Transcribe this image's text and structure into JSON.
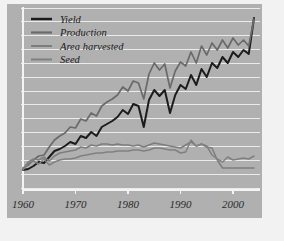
{
  "figure": {
    "panel_bg": "#b0b0b0",
    "outer_bg": "#f2f2f2",
    "grid_color": "#ebebeb",
    "axis_color": "#f4f4f4"
  },
  "chart_data": {
    "type": "line",
    "title": "",
    "subtitle": "",
    "xlabel": "",
    "ylabel": "",
    "xlim": [
      1960,
      2004
    ],
    "ylim": [
      0,
      360
    ],
    "grid": "horizontal",
    "legend_position": "top-left",
    "xticks": [
      1960,
      1970,
      1980,
      1990,
      2000
    ],
    "xtick_labels": [
      "1960",
      "1970",
      "1980",
      "1990",
      "2000"
    ],
    "x": [
      1960,
      1961,
      1962,
      1963,
      1964,
      1965,
      1966,
      1967,
      1968,
      1969,
      1970,
      1971,
      1972,
      1973,
      1974,
      1975,
      1976,
      1977,
      1978,
      1979,
      1980,
      1981,
      1982,
      1983,
      1984,
      1985,
      1986,
      1987,
      1988,
      1989,
      1990,
      1991,
      1992,
      1993,
      1994,
      1995,
      1996,
      1997,
      1998,
      1999,
      2000,
      2001,
      2002,
      2003,
      2004
    ],
    "series": [
      {
        "name": "Yield",
        "color": "#1c1c1c",
        "width": 2.0,
        "values": [
          36,
          38,
          44,
          52,
          50,
          62,
          74,
          78,
          84,
          92,
          88,
          104,
          100,
          112,
          104,
          122,
          128,
          134,
          142,
          156,
          148,
          168,
          164,
          122,
          176,
          196,
          184,
          196,
          150,
          186,
          206,
          198,
          226,
          206,
          238,
          222,
          250,
          240,
          262,
          250,
          272,
          262,
          276,
          268,
          340
        ]
      },
      {
        "name": "Production",
        "color": "#6a6a6a",
        "width": 1.7,
        "values": [
          40,
          46,
          56,
          64,
          66,
          82,
          96,
          104,
          110,
          122,
          120,
          138,
          134,
          150,
          144,
          164,
          172,
          178,
          186,
          202,
          194,
          214,
          210,
          178,
          228,
          250,
          236,
          248,
          200,
          234,
          252,
          244,
          272,
          250,
          284,
          266,
          290,
          276,
          296,
          280,
          300,
          286,
          296,
          284,
          338
        ]
      },
      {
        "name": "Area harvested",
        "color": "#7d7d7d",
        "width": 1.5,
        "values": [
          38,
          52,
          58,
          56,
          62,
          54,
          64,
          70,
          72,
          74,
          76,
          82,
          80,
          86,
          84,
          88,
          88,
          86,
          88,
          86,
          86,
          84,
          86,
          82,
          86,
          90,
          88,
          86,
          84,
          82,
          80,
          86,
          92,
          84,
          88,
          82,
          80,
          56,
          40,
          40,
          40,
          40,
          40,
          40,
          40
        ]
      },
      {
        "name": "Seed",
        "color": "#808080",
        "width": 1.5,
        "values": [
          36,
          50,
          54,
          48,
          58,
          46,
          52,
          56,
          58,
          58,
          60,
          64,
          66,
          68,
          70,
          70,
          72,
          72,
          74,
          74,
          74,
          76,
          76,
          74,
          76,
          80,
          80,
          78,
          76,
          76,
          70,
          72,
          96,
          84,
          88,
          84,
          66,
          58,
          52,
          62,
          56,
          58,
          60,
          58,
          64
        ]
      }
    ]
  },
  "legend": {
    "items": [
      {
        "label": "Yield",
        "color": "#1c1c1c",
        "width": 2.4
      },
      {
        "label": "Production",
        "color": "#6a6a6a",
        "width": 2.2
      },
      {
        "label": "Area harvested",
        "color": "#7d7d7d",
        "width": 2.0
      },
      {
        "label": "Seed",
        "color": "#808080",
        "width": 2.0
      }
    ]
  }
}
